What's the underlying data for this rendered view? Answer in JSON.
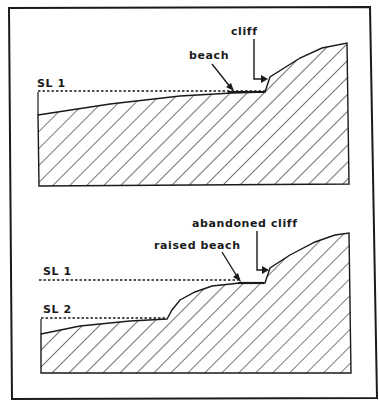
{
  "figure": {
    "colors": {
      "ink": "#1a1a1a",
      "background": "#ffffff"
    },
    "top_panel": {
      "sea_level_label": "SL 1",
      "labels": {
        "beach": "beach",
        "cliff": "cliff"
      }
    },
    "bottom_panel": {
      "sea_level_labels": [
        "SL 1",
        "SL 2"
      ],
      "labels": {
        "raised_beach": "raised beach",
        "abandoned_cliff": "abandoned cliff"
      }
    }
  }
}
